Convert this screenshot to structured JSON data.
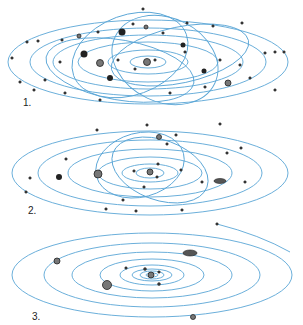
{
  "panels": [
    {
      "label": "1.",
      "description": "Chaotic early system with many bodies and crossing orbits"
    },
    {
      "label": "2.",
      "description": "Intermediate system, fewer bodies, orbits settling"
    },
    {
      "label": "3.",
      "description": "Stable system with concentric orbits"
    }
  ],
  "colors": {
    "orbit": "#5aa6d6",
    "body": "#3a3a3a",
    "background": "#ffffff"
  }
}
